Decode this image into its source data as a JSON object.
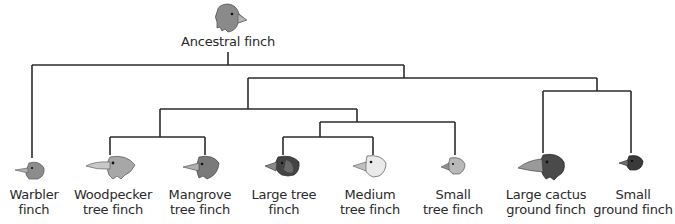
{
  "root": {
    "label": "Ancestral finch",
    "icon": "finch-head-icon"
  },
  "species": [
    {
      "id": "warbler",
      "line1": "Warbler",
      "line2": "finch",
      "head_color": "#8c8c8c"
    },
    {
      "id": "woodpecker",
      "line1": "Woodpecker",
      "line2": "tree finch",
      "head_color": "#a7a7a7"
    },
    {
      "id": "mangrove",
      "line1": "Mangrove",
      "line2": "tree finch",
      "head_color": "#7a7a7a"
    },
    {
      "id": "large-tree",
      "line1": "Large tree",
      "line2": "finch",
      "head_color": "#444444"
    },
    {
      "id": "medium-tree",
      "line1": "Medium",
      "line2": "tree finch",
      "head_color": "#eaeaea"
    },
    {
      "id": "small-tree",
      "line1": "Small",
      "line2": "tree finch",
      "head_color": "#b8b8b8"
    },
    {
      "id": "large-cactus-ground",
      "line1": "Large cactus",
      "line2": "ground finch",
      "head_color": "#4a4a4a"
    },
    {
      "id": "small-ground",
      "line1": "Small",
      "line2": "ground finch",
      "head_color": "#3a3a3a"
    }
  ],
  "colors": {
    "line": "#2b2b2b",
    "text": "#2a2a2a",
    "beak": "#b5b5b5"
  }
}
